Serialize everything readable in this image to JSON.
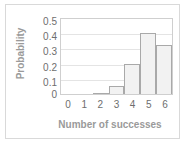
{
  "figure": {
    "background_color": "#ffffff",
    "frame_color": "#d9d9d9",
    "axis_color": "#cfcfcf",
    "grid_color": "#e4e4e4",
    "bar_fill_color": "#f2f2f2",
    "bar_border_color": "#a9a9a9",
    "tick_text_color": "#6e6e6e",
    "axis_title_color": "#9a9a9a"
  },
  "chart_data": {
    "type": "bar",
    "title": "",
    "subtitle": "",
    "xlabel": "Number of successes",
    "ylabel": "Probability",
    "categories": [
      "0",
      "1",
      "2",
      "3",
      "4",
      "5",
      "6"
    ],
    "values": [
      0.0,
      0.0,
      0.008,
      0.054,
      0.2,
      0.41,
      0.33
    ],
    "xticklabels": [
      "0",
      "1",
      "2",
      "3",
      "4",
      "5",
      "6"
    ],
    "yticklabels": [
      "0.5",
      "0.4",
      "0.3",
      "0.2",
      "0.1",
      "0"
    ],
    "ytickvalues": [
      0.5,
      0.4,
      0.3,
      0.2,
      0.1,
      0
    ],
    "ylim": [
      0,
      0.5
    ],
    "xlim": [
      -0.5,
      6.5
    ],
    "grid": true,
    "grid_axis": "y",
    "legend": false,
    "legend_position": "none",
    "series": [
      {
        "name": "Probability",
        "values": [
          0.0,
          0.0,
          0.008,
          0.054,
          0.2,
          0.41,
          0.33
        ]
      }
    ],
    "annotations": []
  }
}
